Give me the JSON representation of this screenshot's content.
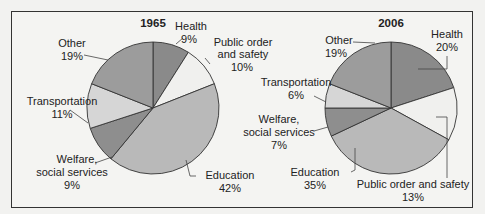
{
  "chart_data": [
    {
      "type": "pie",
      "title": "1965",
      "categories": [
        "Health",
        "Public order and safety",
        "Education",
        "Welfare, social services",
        "Transportation",
        "Other"
      ],
      "values": [
        9,
        10,
        42,
        9,
        11,
        19
      ],
      "labels": [
        "Health",
        "Public order and safety",
        "Education",
        "Welfare, social services",
        "Transportation",
        "Other"
      ],
      "value_labels": [
        "9%",
        "10%",
        "42%",
        "9%",
        "11%",
        "19%"
      ]
    },
    {
      "type": "pie",
      "title": "2006",
      "categories": [
        "Health",
        "Public order and safety",
        "Education",
        "Welfare, social services",
        "Transportation",
        "Other"
      ],
      "values": [
        20,
        13,
        35,
        7,
        6,
        19
      ],
      "labels": [
        "Health",
        "Public order and safety",
        "Education",
        "Welfare, social services",
        "Transportation",
        "Other"
      ],
      "value_labels": [
        "20%",
        "13%",
        "35%",
        "7%",
        "6%",
        "19%"
      ]
    }
  ],
  "colors": {
    "Health": "#8a8a8a",
    "Public order and safety": "#f0f0ee",
    "Education": "#b9b9b9",
    "Welfare, social services": "#8e8e8e",
    "Transportation": "#d6d6d6",
    "Other": "#9c9c9c"
  },
  "text": {
    "c1_title": "1965",
    "c1_health": "Health",
    "c1_health_pct": "9%",
    "c1_public1": "Public order",
    "c1_public2": "and safety",
    "c1_public_pct": "10%",
    "c1_edu": "Education",
    "c1_edu_pct": "42%",
    "c1_welf1": "Welfare,",
    "c1_welf2": "social services",
    "c1_welf_pct": "9%",
    "c1_trans": "Transportation",
    "c1_trans_pct": "11%",
    "c1_other": "Other",
    "c1_other_pct": "19%",
    "c2_title": "2006",
    "c2_health": "Health",
    "c2_health_pct": "20%",
    "c2_public": "Public order and safety",
    "c2_public_pct": "13%",
    "c2_edu": "Education",
    "c2_edu_pct": "35%",
    "c2_welf1": "Welfare,",
    "c2_welf2": "social services",
    "c2_welf_pct": "7%",
    "c2_trans": "Transportation",
    "c2_trans_pct": "6%",
    "c2_other": "Other",
    "c2_other_pct": "19%"
  }
}
